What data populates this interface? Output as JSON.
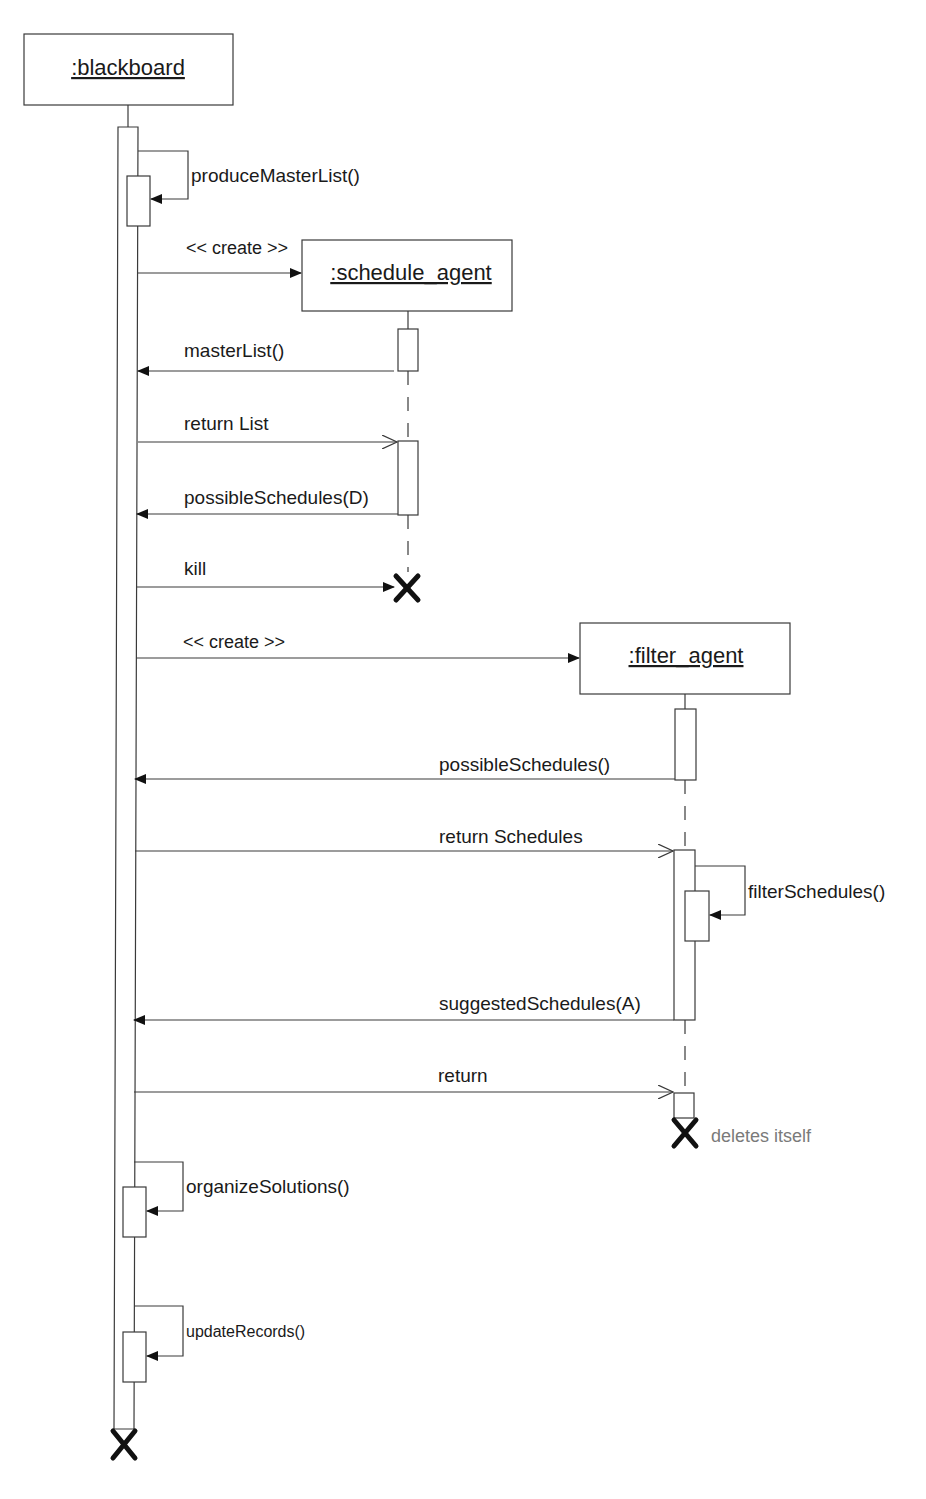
{
  "diagram": {
    "type": "UML sequence diagram",
    "objects": [
      {
        "id": "blackboard",
        "label": ":blackboard"
      },
      {
        "id": "schedule_agent",
        "label": ":schedule_agent"
      },
      {
        "id": "filter_agent",
        "label": ":filter_agent"
      }
    ],
    "messages": [
      {
        "label": "produceMasterList()",
        "from": "blackboard",
        "to": "blackboard",
        "kind": "self-call"
      },
      {
        "label": "<< create >>",
        "from": "blackboard",
        "to": "schedule_agent",
        "kind": "create"
      },
      {
        "label": "masterList()",
        "from": "schedule_agent",
        "to": "blackboard",
        "kind": "sync"
      },
      {
        "label": "return List",
        "from": "blackboard",
        "to": "schedule_agent",
        "kind": "return"
      },
      {
        "label": "possibleSchedules(D)",
        "from": "schedule_agent",
        "to": "blackboard",
        "kind": "sync"
      },
      {
        "label": "kill",
        "from": "blackboard",
        "to": "schedule_agent",
        "kind": "destroy"
      },
      {
        "label": "<< create >>",
        "from": "blackboard",
        "to": "filter_agent",
        "kind": "create"
      },
      {
        "label": "possibleSchedules()",
        "from": "filter_agent",
        "to": "blackboard",
        "kind": "sync"
      },
      {
        "label": "return Schedules",
        "from": "blackboard",
        "to": "filter_agent",
        "kind": "return"
      },
      {
        "label": "filterSchedules()",
        "from": "filter_agent",
        "to": "filter_agent",
        "kind": "self-call"
      },
      {
        "label": "suggestedSchedules(A)",
        "from": "filter_agent",
        "to": "blackboard",
        "kind": "sync"
      },
      {
        "label": "return",
        "from": "blackboard",
        "to": "filter_agent",
        "kind": "return"
      },
      {
        "label": "organizeSolutions()",
        "from": "blackboard",
        "to": "blackboard",
        "kind": "self-call"
      },
      {
        "label": "updateRecords()",
        "from": "blackboard",
        "to": "blackboard",
        "kind": "self-call"
      }
    ],
    "notes": {
      "filter_agent_destroy": "deletes itself"
    }
  }
}
